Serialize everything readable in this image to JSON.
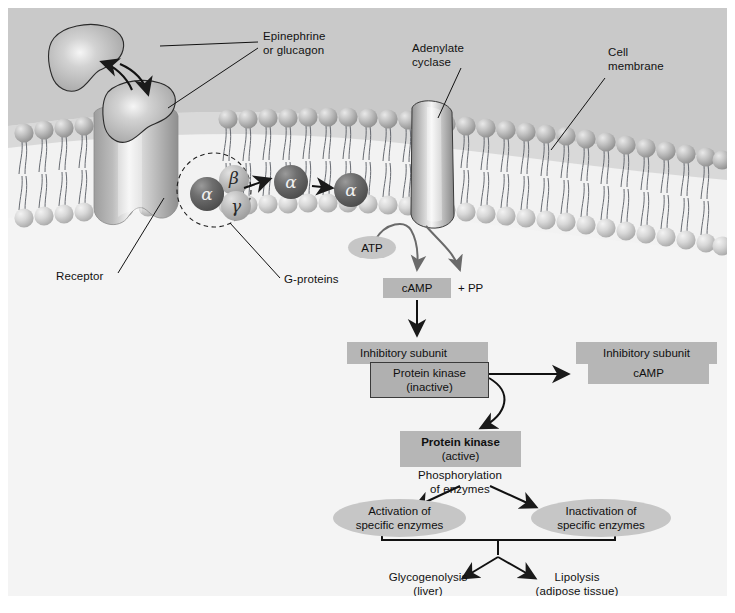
{
  "figure": {
    "background_color": "#f2f2f2",
    "extracellular_color": "#c9c9c9",
    "cytoplasm_color": "#f4f4f4",
    "box_color": "#b6b6b6",
    "ellipse_color": "#c6c6c6",
    "line_color": "#1a1a1a"
  },
  "membrane_labels": {
    "hormone": "Epinephrine\nor glucagon",
    "adenylate_cyclase": "Adenylate\ncyclase",
    "cell_membrane": "Cell\nmembrane",
    "receptor": "Receptor",
    "g_proteins": "G-proteins"
  },
  "subunits": {
    "alpha_complex": "α",
    "beta": "β",
    "gamma": "γ",
    "alpha_free_1": "α",
    "alpha_free_2": "α"
  },
  "cascade": {
    "atp": "ATP",
    "camp": "cAMP",
    "pp": "+ PP",
    "inhibitory_subunit_left": "Inhibitory subunit",
    "protein_kinase_inactive": "Protein kinase\n(inactive)",
    "inhibitory_subunit_right": "Inhibitory subunit",
    "camp_bound": "cAMP",
    "protein_kinase_active_bold": "Protein kinase",
    "protein_kinase_active_state": "(active)",
    "phosphorylation": "Phosphorylation\nof enzymes",
    "activation": "Activation of\nspecific enzymes",
    "inactivation": "Inactivation of\nspecific enzymes",
    "glycogenolysis": "Glycogenolysis\n(liver)",
    "lipolysis": "Lipolysis\n(adipose tissue)"
  },
  "icons": {
    "hormone_free": "hormone-blob-icon",
    "hormone_bound": "hormone-blob-bound-icon",
    "receptor_protein": "receptor-channel-icon",
    "cyclase_protein": "adenylate-cyclase-icon",
    "bilayer": "phospholipid-bilayer-icon",
    "g_protein_dashed_circle": "dashed-circle-icon"
  }
}
